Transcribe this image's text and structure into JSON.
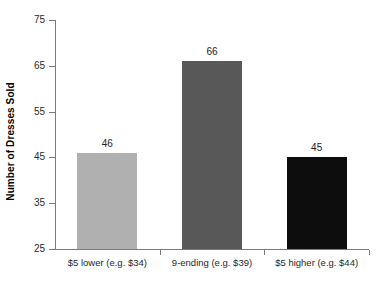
{
  "chart_data": {
    "type": "bar",
    "title": "",
    "subtitle": "",
    "xlabel": "",
    "ylabel": "Number of Dresses Sold",
    "categories": [
      "$5 lower (e.g. $34)",
      "9-ending (e.g. $39)",
      "$5 higher (e.g. $44)"
    ],
    "values": [
      46,
      66,
      45
    ],
    "value_labels": [
      "46",
      "66",
      "45"
    ],
    "bar_colors": [
      "#b0b0b0",
      "#585858",
      "#0d0d0d"
    ],
    "ylim": [
      25,
      75
    ],
    "yticks": [
      25,
      35,
      45,
      55,
      65,
      75
    ],
    "ytick_labels": [
      "25",
      "35",
      "45",
      "55",
      "65",
      "75"
    ],
    "grid": false,
    "legend": false,
    "legend_position": "none",
    "axis_color": "#7a7a7a",
    "background_color": "#ffffff",
    "text_color": "#1a1a1a"
  },
  "axis": {
    "y_title": "Number of Dresses Sold"
  }
}
